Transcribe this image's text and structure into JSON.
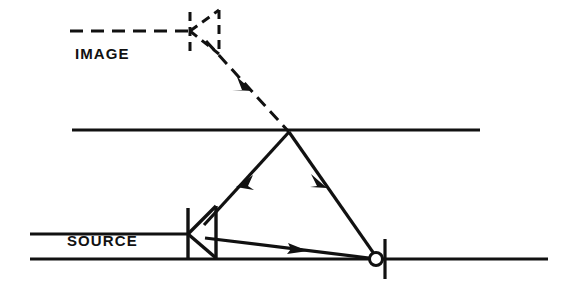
{
  "figure": {
    "background_color": "#ffffff",
    "ink_color": "#111111",
    "width": 577,
    "height": 292
  },
  "labels": {
    "image": "IMAGE",
    "source": "SOURCE"
  },
  "elements": {
    "interface_line_name": "interface-line",
    "boundary_line_name": "boundary-line",
    "image_axis_name": "image-axis-dashed",
    "source_transducer_name": "source-transducer",
    "image_transducer_name": "image-transducer-dashed",
    "reflection_point_name": "reflection-point-marker",
    "incident_ray_name": "incident-ray",
    "reflected_ray_name": "reflected-ray",
    "virtual_ray_name": "virtual-ray-dashed",
    "direct_ray_name": "direct-ray"
  },
  "geometry": {
    "interface_line": {
      "x1": 72,
      "y1": 130,
      "x2": 480,
      "y2": 130
    },
    "boundary_line": {
      "x1": 30,
      "y1": 259,
      "x2": 548,
      "y2": 259
    },
    "image_axis_dashed": {
      "x1": 70,
      "y1": 31,
      "x2": 190,
      "y2": 31
    },
    "image_transducer": {
      "apex_x": 190,
      "apex_y": 31,
      "stem_top_y": 12,
      "stem_bottom_y": 52,
      "mouth_x": 219,
      "mouth_top_y": 10,
      "mouth_bottom_y": 54
    },
    "source_transducer": {
      "apex_x": 188,
      "apex_y": 234,
      "stem_top_y": 208,
      "stem_bottom_y": 258,
      "mouth_x": 216,
      "mouth_top_y": 206,
      "mouth_bottom_y": 258
    },
    "reflection_point": {
      "cx": 376,
      "cy": 259,
      "r": 7
    },
    "apex_point": {
      "x": 287,
      "y": 130
    },
    "virtual_ray": {
      "x1": 205,
      "y1": 40,
      "x2": 287,
      "y2": 130
    },
    "incident_ray": {
      "x1": 287,
      "y1": 130,
      "x2": 205,
      "y2": 224
    },
    "reflected_ray": {
      "x1": 287,
      "y1": 130,
      "x2": 376,
      "y2": 259
    },
    "direct_ray": {
      "x1": 205,
      "y1": 237,
      "x2": 376,
      "y2": 259
    },
    "tick_mark": {
      "x": 384,
      "y1": 240,
      "y2": 278
    },
    "image_label_pos": {
      "x": 75,
      "y": 58
    },
    "source_label_pos": {
      "x": 67,
      "y": 245
    }
  },
  "arrows": {
    "virtual_ray_arrow": {
      "x": 249,
      "y": 88,
      "direction": "down-right"
    },
    "incident_ray_arrow": {
      "x": 243,
      "y": 180,
      "direction": "up-left"
    },
    "reflected_ray_arrow": {
      "x": 322,
      "y": 180,
      "direction": "down-right"
    },
    "direct_ray_arrow": {
      "x": 295,
      "y": 248,
      "direction": "right"
    }
  },
  "styles": {
    "line_width": 3,
    "dash_pattern": "11 7",
    "thin_line_width": 2.6
  }
}
